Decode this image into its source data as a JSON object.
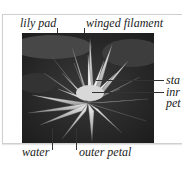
{
  "figure": {
    "labels": {
      "top_left": "lily pad",
      "top_right": "winged filament",
      "right_1": "sta",
      "right_2a": "inr",
      "right_2b": "pet",
      "bottom_left": "water",
      "bottom_right": "outer petal"
    },
    "colors": {
      "background": "#ffffff",
      "frame_border": "#cfcfcf",
      "photo_dark": "#2b2b2b",
      "petal_light": "#e8e8e8",
      "leader_line": "#333333"
    }
  }
}
